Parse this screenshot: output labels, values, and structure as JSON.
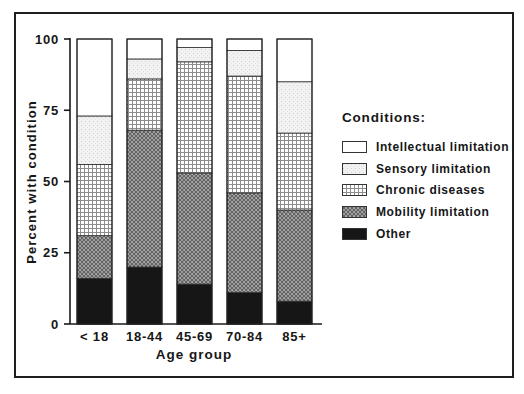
{
  "colors": {
    "ink": "#1a1a1a",
    "bar_outline": "#2b2b2b",
    "black_fill": "#161616",
    "white_fill": "#ffffff",
    "background": "#ffffff"
  },
  "chart_data": {
    "type": "bar",
    "subtype": "stacked-vertical",
    "title": "",
    "xlabel": "Age group",
    "ylabel": "Percent with condition",
    "ylim": [
      0,
      100
    ],
    "yticks": [
      0,
      25,
      50,
      75,
      100
    ],
    "grid": "off",
    "categories": [
      "< 18",
      "18-44",
      "45-69",
      "70-84",
      "85+"
    ],
    "stack_order": "bottom-to-top",
    "series": [
      {
        "name": "Other",
        "pattern": "solid-black",
        "values": [
          16,
          20,
          14,
          11,
          8
        ]
      },
      {
        "name": "Mobility limitation",
        "pattern": "crosshatch",
        "values": [
          15,
          48,
          39,
          35,
          32
        ]
      },
      {
        "name": "Chronic diseases",
        "pattern": "grid",
        "values": [
          25,
          18,
          39,
          41,
          27
        ]
      },
      {
        "name": "Sensory limitation",
        "pattern": "stipple",
        "values": [
          17,
          7,
          5,
          9,
          18
        ]
      },
      {
        "name": "Intellectual limitation",
        "pattern": "solid-white",
        "values": [
          27,
          7,
          3,
          4,
          15
        ]
      }
    ],
    "legend": {
      "title": "Conditions:",
      "position": "right"
    }
  }
}
